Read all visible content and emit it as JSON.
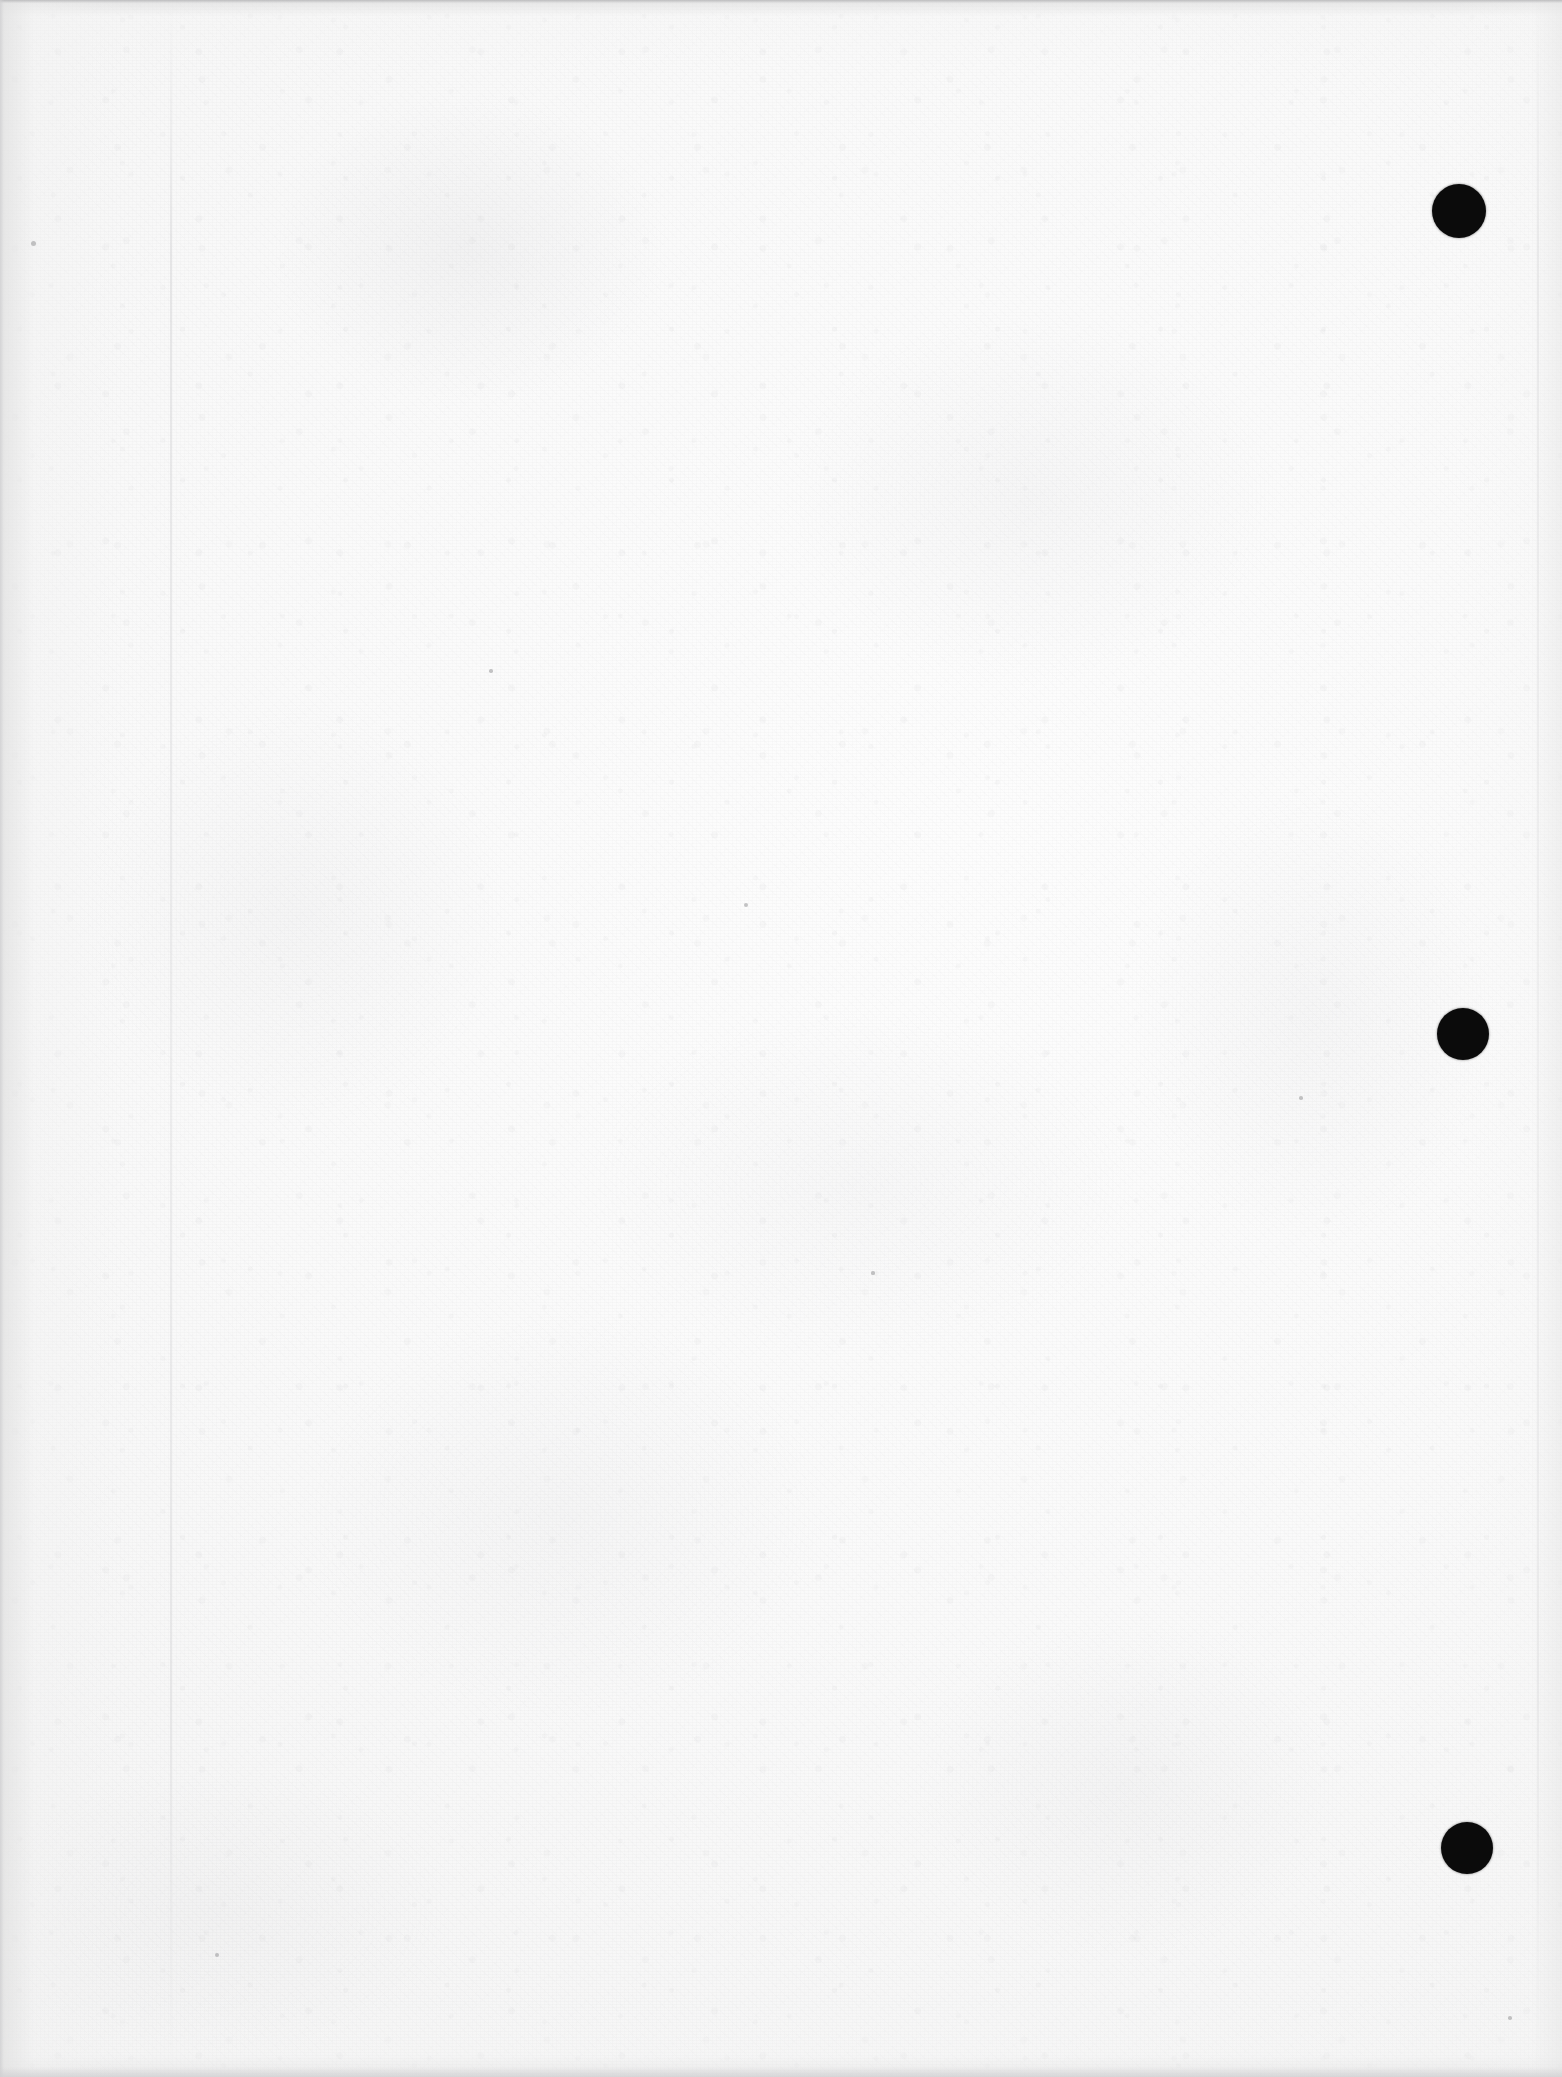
{
  "document": {
    "page_kind": "scanned-blank-page",
    "page_width": 1562,
    "page_height": 2077,
    "visible_text": "",
    "background_color": "#f8f8f8",
    "mark_color": "#0b0b0b",
    "crease_color": "#d6d6d8",
    "edge_shadow_color": "#cecece"
  },
  "marks": {
    "label": "punch-hole marks",
    "count": 3,
    "items": [
      {
        "name": "punch-mark-top",
        "cx": 1459,
        "cy": 211,
        "diameter": 54
      },
      {
        "name": "punch-mark-middle",
        "cx": 1463,
        "cy": 1034,
        "diameter": 52
      },
      {
        "name": "punch-mark-bottom",
        "cx": 1467,
        "cy": 1848,
        "diameter": 52
      }
    ]
  },
  "creases": {
    "items": [
      {
        "name": "crease-left",
        "x": 170
      },
      {
        "name": "crease-right",
        "x": 1537
      }
    ]
  },
  "specks": {
    "items": [
      {
        "cx": 33,
        "cy": 243,
        "r": 2.5
      },
      {
        "cx": 746,
        "cy": 905,
        "r": 2.0
      },
      {
        "cx": 1301,
        "cy": 1098,
        "r": 1.8
      },
      {
        "cx": 217,
        "cy": 1955,
        "r": 2.2
      },
      {
        "cx": 1510,
        "cy": 2018,
        "r": 1.8
      },
      {
        "cx": 873,
        "cy": 1273,
        "r": 1.6
      },
      {
        "cx": 491,
        "cy": 671,
        "r": 1.7
      }
    ]
  }
}
